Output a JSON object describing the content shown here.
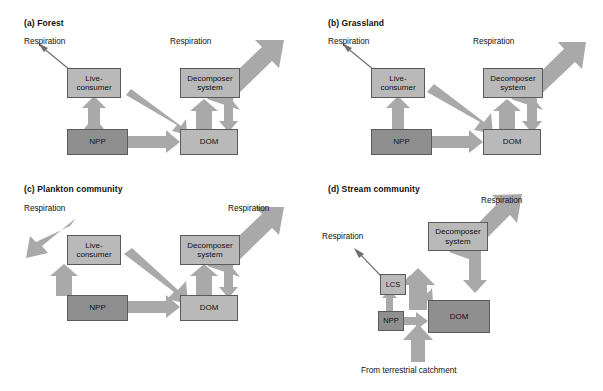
{
  "figure": {
    "background": "#ffffff",
    "box_light_color": "#b9b9b9",
    "box_dark_color": "#8f8f8f",
    "arrow_color": "#a9a9a9",
    "line_color": "#6e6e6e"
  },
  "panels": [
    {
      "id": "forest",
      "label": "(a)",
      "title": "Forest",
      "title_full": "(a) Forest",
      "boxes": [
        {
          "name": "live-consumer",
          "text_line1": "Live-",
          "text_line2": "consumer",
          "shade": "light"
        },
        {
          "name": "decomposer-system",
          "text_line1": "Decomposer",
          "text_line2": "system",
          "shade": "light"
        },
        {
          "name": "npp",
          "text_line1": "NPP",
          "text_line2": "",
          "shade": "dark"
        },
        {
          "name": "dom",
          "text_line1": "DOM",
          "text_line2": "",
          "shade": "light"
        }
      ],
      "captions": [
        {
          "name": "respiration-left",
          "text": "Respiration"
        },
        {
          "name": "respiration-right",
          "text": "Respiration"
        }
      ]
    },
    {
      "id": "grassland",
      "label": "(b)",
      "title": "Grassland",
      "title_full": "(b) Grassland",
      "boxes": [
        {
          "name": "live-consumer",
          "text_line1": "Live-",
          "text_line2": "consumer",
          "shade": "light"
        },
        {
          "name": "decomposer-system",
          "text_line1": "Decomposer",
          "text_line2": "system",
          "shade": "light"
        },
        {
          "name": "npp",
          "text_line1": "NPP",
          "text_line2": "",
          "shade": "dark"
        },
        {
          "name": "dom",
          "text_line1": "DOM",
          "text_line2": "",
          "shade": "light"
        }
      ],
      "captions": [
        {
          "name": "respiration-left",
          "text": "Respiration"
        },
        {
          "name": "respiration-right",
          "text": "Respiration"
        }
      ]
    },
    {
      "id": "plankton-community",
      "label": "(c)",
      "title": "Plankton community",
      "title_full": "(c) Plankton community",
      "boxes": [
        {
          "name": "live-consumer",
          "text_line1": "Live-",
          "text_line2": "consumer",
          "shade": "light"
        },
        {
          "name": "decomposer-system",
          "text_line1": "Decomposer",
          "text_line2": "system",
          "shade": "light"
        },
        {
          "name": "npp",
          "text_line1": "NPP",
          "text_line2": "",
          "shade": "dark"
        },
        {
          "name": "dom",
          "text_line1": "DOM",
          "text_line2": "",
          "shade": "light"
        }
      ],
      "captions": [
        {
          "name": "respiration-left",
          "text": "Respiration"
        },
        {
          "name": "respiration-right",
          "text": "Respiration"
        }
      ]
    },
    {
      "id": "stream-community",
      "label": "(d)",
      "title": "Stream community",
      "title_full": "(d) Stream community",
      "boxes": [
        {
          "name": "lcs",
          "text_line1": "LCS",
          "text_line2": "",
          "shade": "light"
        },
        {
          "name": "decomposer-system",
          "text_line1": "Decomposer",
          "text_line2": "system",
          "shade": "light"
        },
        {
          "name": "npp",
          "text_line1": "NPP",
          "text_line2": "",
          "shade": "dark"
        },
        {
          "name": "dom",
          "text_line1": "DOM",
          "text_line2": "",
          "shade": "dark"
        }
      ],
      "captions": [
        {
          "name": "respiration-left",
          "text": "Respiration"
        },
        {
          "name": "respiration-right",
          "text": "Respiration"
        },
        {
          "name": "terrestrial-input",
          "text": "From terrestrial catchment"
        }
      ]
    }
  ]
}
